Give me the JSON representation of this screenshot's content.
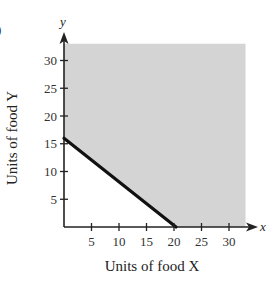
{
  "chart_data": {
    "type": "area",
    "title": "",
    "xlabel": "Units of food X",
    "ylabel": "Units of food Y",
    "x_axis_var": "x",
    "y_axis_var": "y",
    "xlim": [
      0,
      33
    ],
    "ylim": [
      0,
      33
    ],
    "x_ticks": [
      5,
      10,
      15,
      20,
      25,
      30
    ],
    "y_ticks": [
      5,
      10,
      15,
      20,
      25,
      30
    ],
    "x_tick_labels": [
      "5",
      "10",
      "15",
      "20",
      "25",
      "30"
    ],
    "y_tick_labels": [
      "5",
      "10",
      "15",
      "20",
      "25",
      "30"
    ],
    "grid": false,
    "boundary_line": {
      "points": [
        [
          0,
          16
        ],
        [
          20,
          0
        ]
      ],
      "style": "solid, thick, black"
    },
    "shaded_region": {
      "description": "Feasible region above/right of boundary line, x >= 0, y >= 0",
      "vertices": [
        [
          0,
          16
        ],
        [
          0,
          33
        ],
        [
          33,
          33
        ],
        [
          33,
          0
        ],
        [
          20,
          0
        ]
      ],
      "color": "#d4d4d4"
    }
  },
  "colors": {
    "shading": "#d4d4d4",
    "line": "#111111",
    "axis": "#222222"
  },
  "corner_mark": ")"
}
